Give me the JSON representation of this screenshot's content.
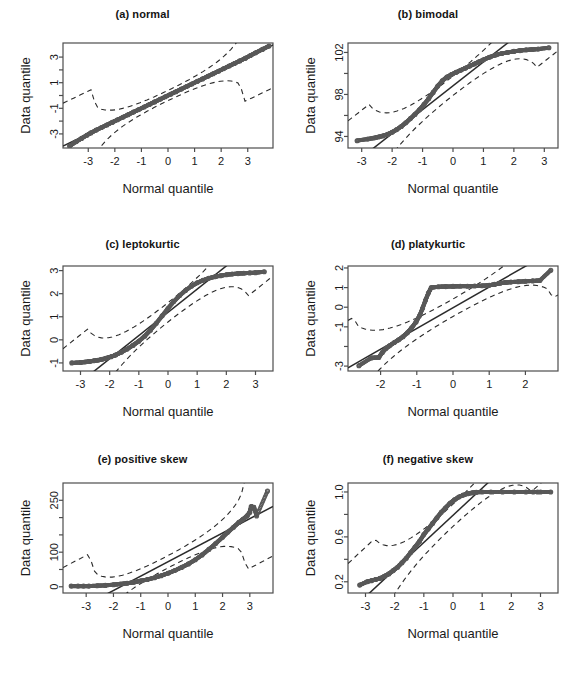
{
  "figure": {
    "layout": "2 columns x 3 rows",
    "background": "#ffffff",
    "point_color": "#595959",
    "line_color": "#2b2b2b",
    "axis_color": "#4d4d4d"
  },
  "chart_data": [
    {
      "type": "scatter",
      "title": "(a) normal",
      "xlabel": "Normal quantile",
      "ylabel": "Data quantile",
      "xlim": [
        -3.95,
        3.95
      ],
      "ylim": [
        -4.1,
        4.1
      ],
      "xticks": [
        -3,
        -2,
        -1,
        0,
        1,
        2,
        3
      ],
      "xtick_labels": [
        "-3",
        "-2",
        "-1",
        "0",
        "1",
        "2",
        "3"
      ],
      "yticks": [
        -3,
        -2,
        -1,
        0,
        1,
        2,
        3
      ],
      "ytick_labels": [
        "-3",
        "",
        "-1",
        "",
        "1",
        "",
        "3"
      ],
      "grid": false,
      "legend": "none",
      "reference_line": {
        "style": "solid",
        "intercept": 0.0,
        "slope": 1.0
      },
      "confidence_band": {
        "style": "dashed",
        "description": "pointwise envelope hugging the reference line, flaring at both tails"
      },
      "points": {
        "description": "standard normal sample; points lie essentially on the 1:1 line across the full range",
        "x": [
          -3.7,
          -3.45,
          -3.25,
          -3.05,
          -2.9,
          -2.7,
          -2.5,
          -2.3,
          -2.1,
          -1.9,
          -1.7,
          -1.5,
          -1.3,
          -1.1,
          -0.9,
          -0.7,
          -0.5,
          -0.3,
          -0.1,
          0.1,
          0.3,
          0.5,
          0.7,
          0.9,
          1.1,
          1.3,
          1.5,
          1.7,
          1.9,
          2.1,
          2.3,
          2.5,
          2.7,
          2.9,
          3.1,
          3.3,
          3.55,
          3.8
        ],
        "y": [
          -3.95,
          -3.6,
          -3.35,
          -3.1,
          -2.92,
          -2.7,
          -2.5,
          -2.3,
          -2.1,
          -1.9,
          -1.7,
          -1.5,
          -1.3,
          -1.1,
          -0.9,
          -0.7,
          -0.5,
          -0.3,
          -0.1,
          0.1,
          0.3,
          0.5,
          0.7,
          0.9,
          1.1,
          1.3,
          1.5,
          1.7,
          1.9,
          2.1,
          2.3,
          2.5,
          2.7,
          2.9,
          3.12,
          3.34,
          3.6,
          3.86
        ]
      }
    },
    {
      "type": "scatter",
      "title": "(b) bimodal",
      "xlabel": "Normal quantile",
      "ylabel": "Data quantile",
      "xlim": [
        -3.45,
        3.45
      ],
      "ylim": [
        92.9,
        102.9
      ],
      "xticks": [
        -3,
        -2,
        -1,
        0,
        1,
        2,
        3
      ],
      "xtick_labels": [
        "-3",
        "-2",
        "-1",
        "0",
        "1",
        "2",
        "3"
      ],
      "yticks": [
        94,
        96,
        98,
        100,
        102
      ],
      "ytick_labels": [
        "94",
        "",
        "98",
        "",
        "102"
      ],
      "grid": false,
      "legend": "none",
      "reference_line": {
        "style": "solid",
        "description": "steep line through the quartiles, crossing the cloud near x=0"
      },
      "confidence_band": {
        "style": "dashed",
        "description": "narrow envelope around the reference line, widening at the tails"
      },
      "points": {
        "description": "bimodal sample: flat shoulders near 94 and 102 with a steep rise through the middle",
        "x": [
          -3.15,
          -2.8,
          -2.6,
          -2.45,
          -2.3,
          -2.15,
          -2.0,
          -1.85,
          -1.7,
          -1.55,
          -1.4,
          -1.25,
          -1.1,
          -0.95,
          -0.8,
          -0.65,
          -0.5,
          -0.35,
          -0.2,
          -0.05,
          0.1,
          0.25,
          0.4,
          0.55,
          0.7,
          0.85,
          1.0,
          1.2,
          1.4,
          1.6,
          1.8,
          2.0,
          2.2,
          2.4,
          2.6,
          2.8,
          3.15
        ],
        "y": [
          93.6,
          93.75,
          93.85,
          93.95,
          94.05,
          94.2,
          94.4,
          94.65,
          94.95,
          95.3,
          95.7,
          96.1,
          96.55,
          97.05,
          97.6,
          98.2,
          98.8,
          99.3,
          99.65,
          99.9,
          100.1,
          100.3,
          100.5,
          100.7,
          100.9,
          101.1,
          101.3,
          101.55,
          101.75,
          101.9,
          102.0,
          102.1,
          102.18,
          102.24,
          102.28,
          102.32,
          102.45
        ]
      }
    },
    {
      "type": "scatter",
      "title": "(c) leptokurtic",
      "xlabel": "Normal quantile",
      "ylabel": "Data quantile",
      "xlim": [
        -3.6,
        3.6
      ],
      "ylim": [
        -1.35,
        3.2
      ],
      "xticks": [
        -3,
        -2,
        -1,
        0,
        1,
        2,
        3
      ],
      "xtick_labels": [
        "-3",
        "-2",
        "-1",
        "0",
        "1",
        "2",
        "3"
      ],
      "yticks": [
        -1,
        0,
        1,
        2,
        3
      ],
      "ytick_labels": [
        "-1",
        "0",
        "1",
        "2",
        "3"
      ],
      "grid": false,
      "legend": "none",
      "reference_line": {
        "style": "solid",
        "description": "steep quartile line that exits the panel at both ends"
      },
      "confidence_band": {
        "style": "dashed",
        "description": "pair of dashed curves bracketing the steep reference line"
      },
      "points": {
        "description": "heavy-tailed (leptokurtic) sample: S-shape flattening into long plateaus at both tails",
        "x": [
          -3.3,
          -3.0,
          -2.85,
          -2.7,
          -2.55,
          -2.4,
          -2.25,
          -2.1,
          -1.95,
          -1.8,
          -1.6,
          -1.4,
          -1.2,
          -1.0,
          -0.8,
          -0.6,
          -0.4,
          -0.2,
          0.0,
          0.2,
          0.4,
          0.6,
          0.8,
          1.0,
          1.2,
          1.4,
          1.6,
          1.8,
          2.0,
          2.2,
          2.4,
          2.6,
          2.8,
          3.0,
          3.3
        ],
        "y": [
          -1.0,
          -0.98,
          -0.96,
          -0.94,
          -0.91,
          -0.88,
          -0.84,
          -0.79,
          -0.73,
          -0.66,
          -0.54,
          -0.4,
          -0.24,
          -0.06,
          0.16,
          0.42,
          0.72,
          1.04,
          1.36,
          1.66,
          1.92,
          2.14,
          2.32,
          2.47,
          2.58,
          2.67,
          2.73,
          2.78,
          2.82,
          2.85,
          2.87,
          2.89,
          2.9,
          2.91,
          2.95
        ]
      }
    },
    {
      "type": "scatter",
      "title": "(d) platykurtic",
      "xlabel": "Normal quantile",
      "ylabel": "Data quantile",
      "xlim": [
        -2.9,
        2.9
      ],
      "ylim": [
        -3.25,
        2.1
      ],
      "xticks": [
        -2,
        -1,
        0,
        1,
        2
      ],
      "xtick_labels": [
        "-2",
        "-1",
        "0",
        "1",
        "2"
      ],
      "yticks": [
        -3,
        -2,
        -1,
        0,
        1,
        2
      ],
      "ytick_labels": [
        "-3",
        "",
        "-1",
        "0",
        "1",
        "2"
      ],
      "grid": false,
      "legend": "none",
      "reference_line": {
        "style": "solid",
        "description": "nearly horizontal line running from about 0.6 on the left to 1.2 on the right"
      },
      "confidence_band": {
        "style": "dashed",
        "description": "dashed envelope tracking the near-horizontal reference line"
      },
      "points": {
        "description": "light-tailed (platykurtic) sample: flat plateau just above 1 for most of the range, dropping steeply below x = -0.6",
        "x": [
          -2.6,
          -2.25,
          -2.05,
          -1.95,
          -1.85,
          -1.75,
          -1.62,
          -1.5,
          -1.38,
          -1.26,
          -1.14,
          -1.02,
          -0.92,
          -0.84,
          -0.76,
          -0.68,
          -0.6,
          -0.4,
          -0.2,
          0.0,
          0.2,
          0.4,
          0.6,
          0.8,
          1.0,
          1.15,
          1.3,
          1.45,
          1.6,
          1.8,
          2.0,
          2.2,
          2.4,
          2.7
        ],
        "y": [
          -2.98,
          -2.58,
          -2.56,
          -2.3,
          -2.1,
          -1.96,
          -1.8,
          -1.66,
          -1.5,
          -1.3,
          -1.05,
          -0.75,
          -0.42,
          -0.05,
          0.35,
          0.72,
          1.0,
          1.04,
          1.05,
          1.06,
          1.07,
          1.07,
          1.08,
          1.09,
          1.12,
          1.16,
          1.22,
          1.26,
          1.28,
          1.3,
          1.32,
          1.34,
          1.36,
          1.88
        ]
      }
    },
    {
      "type": "scatter",
      "title": "(e) positive skew",
      "xlabel": "Normal quantile",
      "ylabel": "Data quantile",
      "xlim": [
        -3.85,
        3.85
      ],
      "ylim": [
        -18,
        300
      ],
      "xticks": [
        -3,
        -2,
        -1,
        0,
        1,
        2,
        3
      ],
      "xtick_labels": [
        "-3",
        "-2",
        "-1",
        "0",
        "1",
        "2",
        "3"
      ],
      "yticks": [
        0,
        50,
        100,
        150,
        200,
        250
      ],
      "ytick_labels": [
        "0",
        "",
        "100",
        "",
        "",
        "250"
      ],
      "grid": false,
      "legend": "none",
      "reference_line": {
        "style": "solid",
        "description": "shallow quartile line rising from about 0 at the far left to roughly 85 at the far right"
      },
      "confidence_band": {
        "style": "dashed",
        "description": "dashed envelope close to the shallow reference line, flaring at the right tail"
      },
      "points": {
        "description": "right-skewed sample: convex curve hugging zero on the left and accelerating upward past x = 1",
        "x": [
          -3.55,
          -3.3,
          -3.1,
          -2.9,
          -2.6,
          -2.3,
          -2.0,
          -1.75,
          -1.5,
          -1.25,
          -1.0,
          -0.75,
          -0.5,
          -0.25,
          0.0,
          0.25,
          0.5,
          0.75,
          1.0,
          1.25,
          1.5,
          1.75,
          2.0,
          2.2,
          2.4,
          2.6,
          2.75,
          2.9,
          3.0,
          3.05,
          3.15,
          3.25,
          3.65
        ],
        "y": [
          2,
          2,
          2,
          2,
          3,
          4,
          6,
          8,
          10,
          13,
          17,
          21,
          26,
          32,
          39,
          47,
          56,
          66,
          78,
          92,
          108,
          125,
          143,
          158,
          172,
          186,
          195,
          205,
          215,
          232,
          230,
          205,
          277
        ]
      }
    },
    {
      "type": "scatter",
      "title": "(f) negative skew",
      "xlabel": "Normal quantile",
      "ylabel": "Data quantile",
      "xlim": [
        -3.6,
        3.6
      ],
      "ylim": [
        0.1,
        1.08
      ],
      "xticks": [
        -3,
        -2,
        -1,
        0,
        1,
        2,
        3
      ],
      "xtick_labels": [
        "-3",
        "-2",
        "-1",
        "0",
        "1",
        "2",
        "3"
      ],
      "yticks": [
        0.2,
        0.4,
        0.6,
        0.8,
        1.0
      ],
      "ytick_labels": [
        "0.2",
        "",
        "0.6",
        "",
        "1.0"
      ],
      "grid": false,
      "legend": "none",
      "reference_line": {
        "style": "solid",
        "description": "line from about 0.40 at the far left rising to 1.0 and flattening to the right"
      },
      "confidence_band": {
        "style": "dashed",
        "description": "dashed envelope that fans out on the left tail"
      },
      "points": {
        "description": "left-skewed sample: concave curve rising from about 0.17 and saturating at 1.0 beyond x = 1",
        "x": [
          -3.2,
          -2.95,
          -2.8,
          -2.65,
          -2.5,
          -2.35,
          -2.2,
          -2.05,
          -1.9,
          -1.75,
          -1.6,
          -1.45,
          -1.3,
          -1.15,
          -1.0,
          -0.85,
          -0.7,
          -0.55,
          -0.4,
          -0.25,
          -0.1,
          0.05,
          0.2,
          0.35,
          0.5,
          0.65,
          0.8,
          1.0,
          1.3,
          1.7,
          2.1,
          2.5,
          2.75,
          2.9,
          3.0,
          3.35
        ],
        "y": [
          0.17,
          0.2,
          0.21,
          0.22,
          0.23,
          0.25,
          0.27,
          0.3,
          0.33,
          0.37,
          0.41,
          0.46,
          0.51,
          0.56,
          0.62,
          0.67,
          0.72,
          0.77,
          0.82,
          0.86,
          0.9,
          0.93,
          0.955,
          0.972,
          0.984,
          0.992,
          0.997,
          1.0,
          1.0,
          1.0,
          1.0,
          1.0,
          1.0,
          1.0,
          1.0,
          1.0
        ]
      }
    }
  ]
}
